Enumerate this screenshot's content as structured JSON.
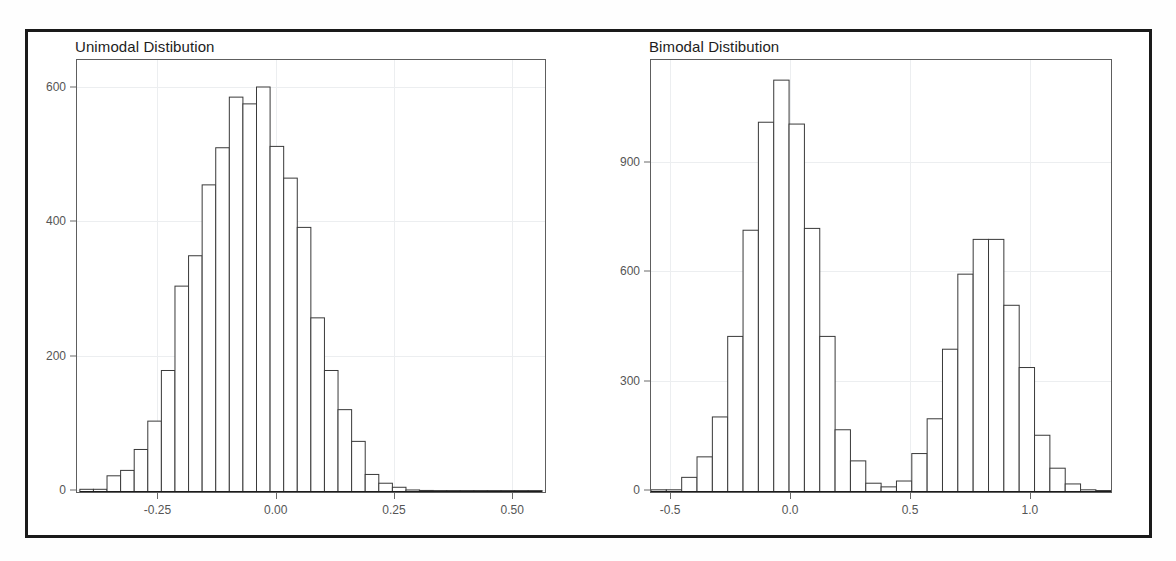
{
  "figure": {
    "background_color": "#ffffff",
    "frame_color": "#1a1a1a",
    "axis_color": "#5e5e5e",
    "tick_text_color": "#555555",
    "bar_stroke_color": "#3a3a3a",
    "bar_fill_color": "#ffffff",
    "grid_color": "#eceef0"
  },
  "chart_data": [
    {
      "type": "bar",
      "id": "unimodal",
      "title": "Unimodal Distibution",
      "xlabel": "",
      "ylabel": "",
      "xlim": [
        -0.42,
        0.565
      ],
      "ylim": [
        0,
        640
      ],
      "xticks": [
        -0.25,
        0.0,
        0.25,
        0.5
      ],
      "xtick_labels": [
        "-0.25",
        "0.00",
        "0.25",
        "0.50"
      ],
      "yticks": [
        0,
        200,
        400,
        600
      ],
      "ytick_labels": [
        "0",
        "200",
        "400",
        "600"
      ],
      "grid": true,
      "bin_width": 0.0286,
      "bin_left_edges": [
        -0.414,
        -0.3854,
        -0.3568,
        -0.3282,
        -0.2996,
        -0.271,
        -0.2424,
        -0.2138,
        -0.1852,
        -0.1566,
        -0.128,
        -0.0994,
        -0.0708,
        -0.0422,
        -0.0136,
        0.015,
        0.0436,
        0.0722,
        0.1008,
        0.1294,
        0.158,
        0.1866,
        0.2152,
        0.2438,
        0.2724,
        0.301,
        0.3296,
        0.3582,
        0.3868,
        0.4154,
        0.444,
        0.4726,
        0.5012,
        0.5298
      ],
      "values": [
        4,
        4,
        24,
        32,
        63,
        105,
        180,
        305,
        350,
        455,
        510,
        585,
        575,
        600,
        512,
        465,
        392,
        258,
        180,
        122,
        75,
        26,
        13,
        7,
        3,
        2,
        1,
        1,
        0,
        0,
        0,
        0,
        0,
        0
      ],
      "categories": [
        "-0.414",
        "-0.385",
        "-0.357",
        "-0.328",
        "-0.300",
        "-0.271",
        "-0.242",
        "-0.214",
        "-0.185",
        "-0.157",
        "-0.128",
        "-0.099",
        "-0.071",
        "-0.042",
        "-0.014",
        "0.015",
        "0.044",
        "0.072",
        "0.101",
        "0.129",
        "0.158",
        "0.187",
        "0.215",
        "0.244",
        "0.272",
        "0.301",
        "0.330",
        "0.358",
        "0.387",
        "0.415",
        "0.444",
        "0.473",
        "0.501",
        "0.530"
      ]
    },
    {
      "type": "bar",
      "id": "bimodal",
      "title": "Bimodal Distibution",
      "xlabel": "",
      "ylabel": "",
      "xlim": [
        -0.58,
        1.33
      ],
      "ylim": [
        0,
        1180
      ],
      "xticks": [
        -0.5,
        0.0,
        0.5,
        1.0
      ],
      "xtick_labels": [
        "-0.5",
        "0.0",
        "0.5",
        "1.0"
      ],
      "yticks": [
        0,
        300,
        600,
        900
      ],
      "ytick_labels": [
        "0",
        "300",
        "600",
        "900"
      ],
      "grid": true,
      "bin_width": 0.0637,
      "bin_left_edges": [
        -0.58,
        -0.5163,
        -0.4526,
        -0.3889,
        -0.3252,
        -0.2615,
        -0.1978,
        -0.1341,
        -0.0704,
        -0.0067,
        0.057,
        0.1207,
        0.1844,
        0.2481,
        0.3118,
        0.3755,
        0.4392,
        0.5029,
        0.5666,
        0.6303,
        0.694,
        0.7577,
        0.8214,
        0.8851,
        0.9488,
        1.0125,
        1.0762,
        1.1399,
        1.2036,
        1.2673
      ],
      "values": [
        6,
        6,
        40,
        96,
        205,
        425,
        715,
        1010,
        1125,
        1005,
        720,
        425,
        170,
        85,
        24,
        14,
        30,
        105,
        200,
        390,
        595,
        690,
        690,
        510,
        340,
        155,
        65,
        22,
        6,
        4
      ],
      "categories": [
        "-0.580",
        "-0.516",
        "-0.453",
        "-0.389",
        "-0.325",
        "-0.262",
        "-0.198",
        "-0.134",
        "-0.070",
        "-0.007",
        "0.057",
        "0.121",
        "0.184",
        "0.248",
        "0.312",
        "0.376",
        "0.439",
        "0.503",
        "0.567",
        "0.630",
        "0.694",
        "0.758",
        "0.821",
        "0.885",
        "0.949",
        "1.013",
        "1.076",
        "1.140",
        "1.204",
        "1.267"
      ]
    }
  ]
}
